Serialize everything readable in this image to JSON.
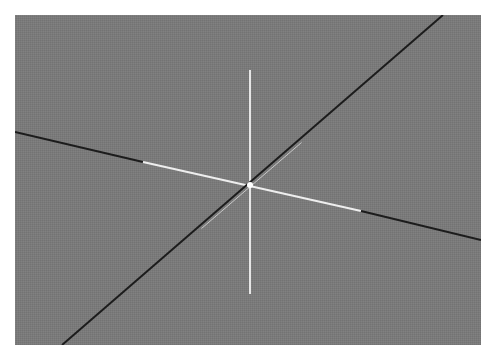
{
  "viewport": {
    "background_color": "#7a7a7a",
    "bounds": {
      "x": 15,
      "y": 15,
      "width": 466,
      "height": 330
    },
    "origin": {
      "x": 250,
      "y": 185
    }
  },
  "axes": [
    {
      "id": "vertical-axis",
      "color": "#e6e6e6",
      "segments": [
        {
          "x1": 250,
          "y1": 70,
          "x2": 250,
          "y2": 294,
          "color": "#e6e6e6",
          "width": 2
        }
      ]
    },
    {
      "id": "horizontal-axis",
      "segments": [
        {
          "x1": 15,
          "y1": 132,
          "x2": 143,
          "y2": 162,
          "color": "#1c1c1c",
          "width": 2
        },
        {
          "x1": 143,
          "y1": 162,
          "x2": 361,
          "y2": 211,
          "color": "#eeeeee",
          "width": 2
        },
        {
          "x1": 361,
          "y1": 211,
          "x2": 481,
          "y2": 240,
          "color": "#1c1c1c",
          "width": 2
        }
      ]
    },
    {
      "id": "diagonal-axis",
      "segments": [
        {
          "x1": 62,
          "y1": 345,
          "x2": 443,
          "y2": 15,
          "color": "#1c1c1c",
          "width": 2
        },
        {
          "x1": 200,
          "y1": 227,
          "x2": 300,
          "y2": 141,
          "color": "#c8c8c8",
          "width": 1,
          "offset": 1.5
        }
      ]
    }
  ],
  "origin_marker": {
    "x": 250,
    "y": 185,
    "r": 3,
    "color": "#ffffff"
  }
}
